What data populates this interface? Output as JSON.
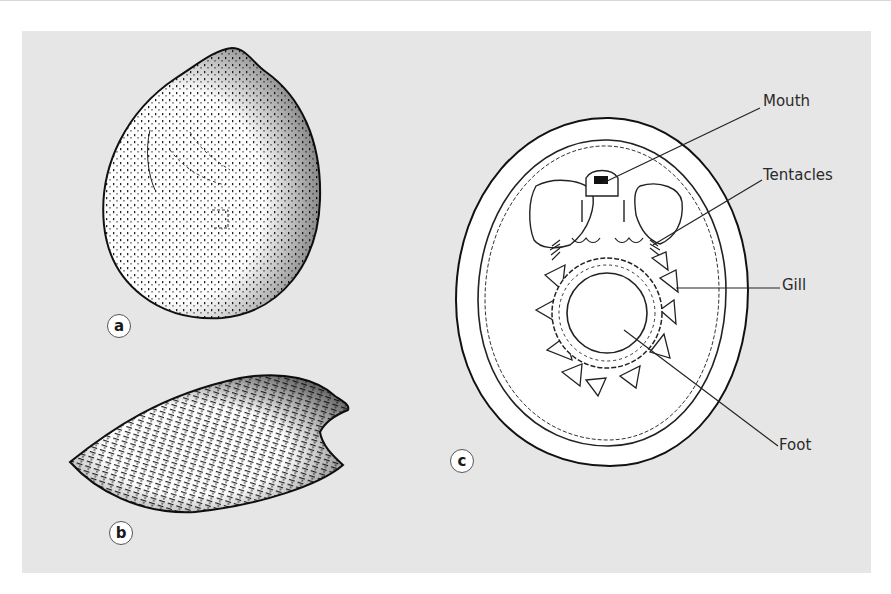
{
  "figure": {
    "panels": [
      {
        "id": "a",
        "badge": "a",
        "description": "bivalve shell, lateral view"
      },
      {
        "id": "b",
        "badge": "b",
        "description": "bivalve shell, elongated view"
      },
      {
        "id": "c",
        "badge": "c",
        "description": "internal anatomy, ventral view"
      }
    ],
    "annotations": {
      "mouth": "Mouth",
      "tentacles": "Tentacles",
      "gill": "Gill",
      "foot": "Foot"
    },
    "colors": {
      "panel_background": "#e6e6e6",
      "ink": "#1a1a1a",
      "fill": "#ffffff"
    }
  }
}
